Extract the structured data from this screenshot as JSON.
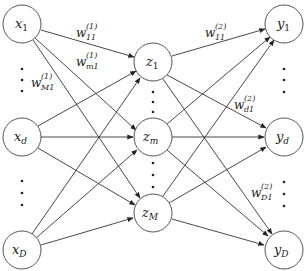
{
  "diagram": {
    "type": "two-layer neural network",
    "colors": {
      "node_stroke": "#555555",
      "edge": "#333333",
      "text": "#222222",
      "background": "#ffffff"
    },
    "layers": {
      "input": [
        {
          "id": "x1",
          "base": "x",
          "sub": "1"
        },
        {
          "id": "xd",
          "base": "x",
          "sub": "d"
        },
        {
          "id": "xD",
          "base": "x",
          "sub": "D"
        }
      ],
      "hidden": [
        {
          "id": "z1",
          "base": "z",
          "sub": "1"
        },
        {
          "id": "zm",
          "base": "z",
          "sub": "m"
        },
        {
          "id": "zM",
          "base": "z",
          "sub": "M"
        }
      ],
      "output": [
        {
          "id": "y1",
          "base": "y",
          "sub": "1"
        },
        {
          "id": "yd",
          "base": "y",
          "sub": "d"
        },
        {
          "id": "yD",
          "base": "y",
          "sub": "D"
        }
      ]
    },
    "weight_labels": [
      {
        "id": "w11_1",
        "base": "w",
        "sub": "11",
        "sup": "(1)"
      },
      {
        "id": "wm1_1",
        "base": "w",
        "sub": "m1",
        "sup": "(1)"
      },
      {
        "id": "wM1_1",
        "base": "w",
        "sub": "M1",
        "sup": "(1)"
      },
      {
        "id": "w11_2",
        "base": "w",
        "sub": "11",
        "sup": "(2)"
      },
      {
        "id": "wd1_2",
        "base": "w",
        "sub": "d1",
        "sup": "(2)"
      },
      {
        "id": "wD1_2",
        "base": "w",
        "sub": "D1",
        "sup": "(2)"
      }
    ]
  }
}
